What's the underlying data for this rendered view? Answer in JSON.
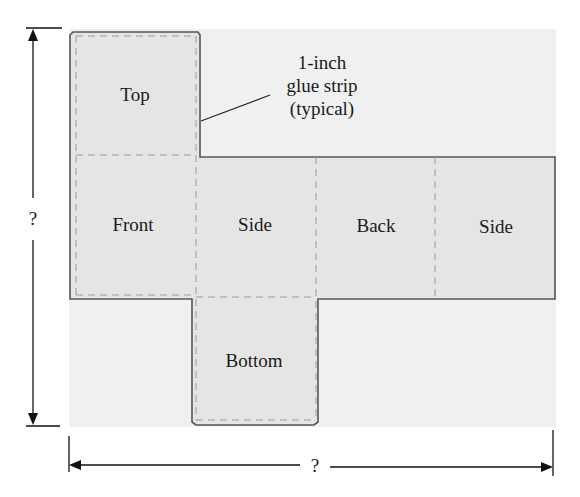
{
  "diagram": {
    "type": "box-net",
    "panels": [
      {
        "id": "top",
        "label": "Top"
      },
      {
        "id": "front",
        "label": "Front"
      },
      {
        "id": "side-left",
        "label": "Side"
      },
      {
        "id": "back",
        "label": "Back"
      },
      {
        "id": "side-right",
        "label": "Side"
      },
      {
        "id": "bottom",
        "label": "Bottom"
      }
    ],
    "callout": {
      "line1": "1-inch",
      "line2": "glue strip",
      "line3": "(typical)"
    },
    "dimensions": {
      "height_label": "?",
      "width_label": "?"
    },
    "colors": {
      "background_panel": "#efefef",
      "net_fill": "#e6e6e6",
      "outline": "#555555",
      "fold_line": "#9a9a9a",
      "arrow": "#111111"
    }
  }
}
